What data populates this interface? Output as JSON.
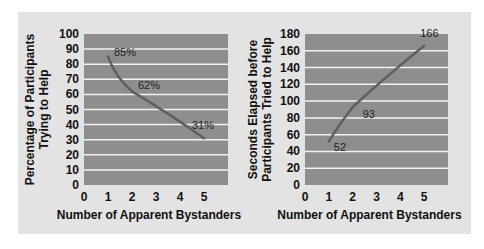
{
  "colors": {
    "panel_bg": "#e3e3e3",
    "plot_bg": "#8e8e8e",
    "gridline": "#f2f2f2",
    "line": "#5f5f5f",
    "text": "#111111"
  },
  "chart_data": [
    {
      "type": "line",
      "title": "",
      "xlabel": "Number of Apparent Bystanders",
      "ylabel": "Percentage of Participants Trying to Help",
      "ylabel_lines": [
        "Percentage of Participants",
        "Trying to Help"
      ],
      "x": [
        1,
        2,
        5
      ],
      "values": [
        85,
        62,
        31
      ],
      "data_labels": [
        "85%",
        "62%",
        "31%"
      ],
      "xticks": [
        "0",
        "1",
        "2",
        "3",
        "4",
        "5"
      ],
      "yticks": [
        "0",
        "10",
        "20",
        "30",
        "40",
        "50",
        "60",
        "70",
        "80",
        "90",
        "100"
      ],
      "xlim": [
        0,
        6
      ],
      "ylim": [
        0,
        100
      ],
      "grid": true,
      "legend": "none"
    },
    {
      "type": "line",
      "title": "",
      "xlabel": "Number of Apparent Bystanders",
      "ylabel": "Seconds Elapsed before Participants Tried to Help",
      "ylabel_lines": [
        "Seconds Elapsed before",
        "Participants Tried to Help"
      ],
      "x": [
        1,
        2,
        5
      ],
      "values": [
        52,
        93,
        166
      ],
      "data_labels": [
        "52",
        "93",
        "166"
      ],
      "xticks": [
        "0",
        "1",
        "2",
        "3",
        "4",
        "5"
      ],
      "yticks": [
        "0",
        "20",
        "40",
        "60",
        "80",
        "100",
        "120",
        "140",
        "160",
        "180"
      ],
      "xlim": [
        0,
        6
      ],
      "ylim": [
        0,
        180
      ],
      "grid": true,
      "legend": "none"
    }
  ]
}
